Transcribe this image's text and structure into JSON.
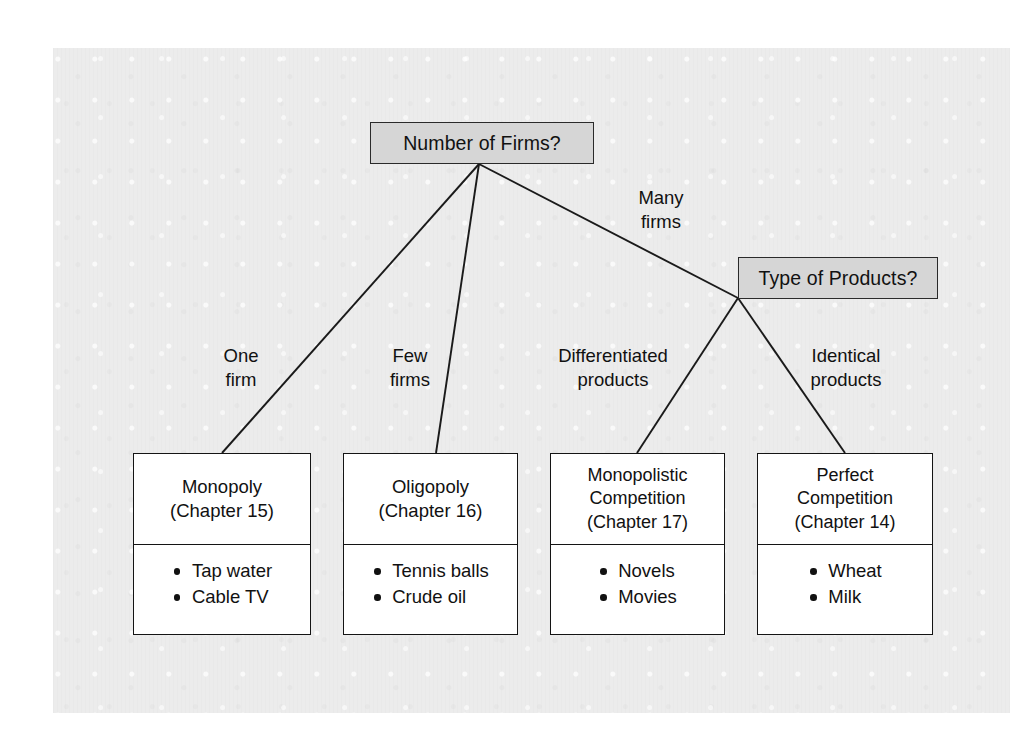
{
  "diagram": {
    "type": "decision-tree",
    "background_color": "#ececec",
    "decision_box_color": "#d6d6d6",
    "line_color": "#1a1a1a",
    "decisions": [
      {
        "id": "number-of-firms",
        "label": "Number of Firms?"
      },
      {
        "id": "type-of-products",
        "label": "Type of Products?"
      }
    ],
    "edge_labels": [
      {
        "id": "one-firm",
        "text": "One\nfirm"
      },
      {
        "id": "few-firms",
        "text": "Few\nfirms"
      },
      {
        "id": "many-firms",
        "text": "Many\nfirms"
      },
      {
        "id": "differentiated-products",
        "text": "Differentiated\nproducts"
      },
      {
        "id": "identical-products",
        "text": "Identical\nproducts"
      }
    ],
    "outcomes": [
      {
        "id": "monopoly",
        "title": "Monopoly\n(Chapter 15)",
        "name": "Monopoly",
        "chapter": "(Chapter 15)",
        "examples": [
          "Tap water",
          "Cable TV"
        ]
      },
      {
        "id": "oligopoly",
        "title": "Oligopoly\n(Chapter 16)",
        "name": "Oligopoly",
        "chapter": "(Chapter 16)",
        "examples": [
          "Tennis balls",
          "Crude oil"
        ]
      },
      {
        "id": "monopolistic-competition",
        "title": "Monopolistic\nCompetition\n(Chapter 17)",
        "name": "Monopolistic Competition",
        "chapter": "(Chapter 17)",
        "examples": [
          "Novels",
          "Movies"
        ]
      },
      {
        "id": "perfect-competition",
        "title": "Perfect\nCompetition\n(Chapter 14)",
        "name": "Perfect Competition",
        "chapter": "(Chapter 14)",
        "examples": [
          "Wheat",
          "Milk"
        ]
      }
    ]
  }
}
